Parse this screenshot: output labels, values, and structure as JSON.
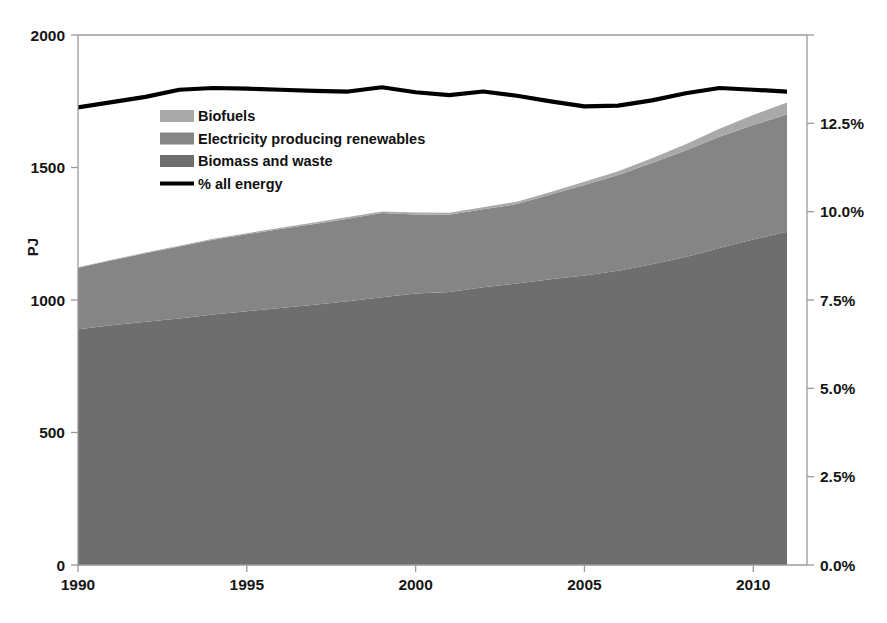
{
  "chart_data": {
    "type": "area",
    "title": "",
    "subtitle": "",
    "xlabel": "",
    "ylabel": "PJ",
    "y2label": "",
    "grid": false,
    "legend_position": "inside-upper-left",
    "xlim": [
      1990,
      2011
    ],
    "ylim": [
      0,
      2000
    ],
    "y2lim": [
      0.0,
      15.0
    ],
    "x_ticks": [
      1990,
      1995,
      2000,
      2005,
      2010
    ],
    "x_tick_labels": [
      "1990",
      "1995",
      "2000",
      "2005",
      "2010"
    ],
    "y_ticks": [
      0,
      500,
      1000,
      1500,
      2000
    ],
    "y_tick_labels": [
      "0",
      "500",
      "1000",
      "1500",
      "2000"
    ],
    "y2_ticks": [
      0.0,
      2.5,
      5.0,
      7.5,
      10.0,
      12.5
    ],
    "y2_tick_labels": [
      "0.0%",
      "2.5%",
      "5.0%",
      "7.5%",
      "10.0%",
      "12.5%"
    ],
    "x": [
      1990,
      1991,
      1992,
      1993,
      1994,
      1995,
      1996,
      1997,
      1998,
      1999,
      2000,
      2001,
      2002,
      2003,
      2004,
      2005,
      2006,
      2007,
      2008,
      2009,
      2010,
      2011
    ],
    "stack_order": [
      "Biomass and waste",
      "Electricity producing renewables",
      "Biofuels"
    ],
    "series": [
      {
        "name": "Biomass and waste",
        "axis": "left",
        "units": "PJ",
        "color": "#6e6e6e",
        "values": [
          890,
          905,
          918,
          930,
          945,
          958,
          970,
          982,
          995,
          1010,
          1025,
          1030,
          1048,
          1062,
          1078,
          1092,
          1110,
          1135,
          1162,
          1196,
          1228,
          1258
        ]
      },
      {
        "name": "Electricity producing renewables",
        "axis": "left",
        "units": "PJ",
        "color": "#858585",
        "values": [
          232,
          245,
          258,
          272,
          282,
          290,
          298,
          305,
          312,
          318,
          298,
          292,
          294,
          300,
          320,
          342,
          362,
          382,
          402,
          420,
          432,
          442
        ]
      },
      {
        "name": "Biofuels",
        "axis": "left",
        "units": "PJ",
        "color": "#a9a9a9",
        "values": [
          2,
          2,
          3,
          3,
          4,
          4,
          5,
          5,
          6,
          6,
          7,
          7,
          8,
          9,
          10,
          12,
          14,
          18,
          24,
          30,
          38,
          45
        ]
      },
      {
        "name": "% all energy",
        "axis": "right",
        "units": "%",
        "color": "#000000",
        "style": "line",
        "values": [
          12.95,
          13.1,
          13.25,
          13.45,
          13.5,
          13.48,
          13.45,
          13.42,
          13.4,
          13.52,
          13.38,
          13.3,
          13.4,
          13.28,
          13.12,
          12.98,
          13.0,
          13.15,
          13.35,
          13.5,
          13.45,
          13.4
        ]
      }
    ],
    "legend_entries": [
      {
        "label": "Biofuels",
        "swatch": "#a9a9a9",
        "type": "area"
      },
      {
        "label": "Electricity producing renewables",
        "swatch": "#858585",
        "type": "area"
      },
      {
        "label": "Biomass and waste",
        "swatch": "#6e6e6e",
        "type": "area"
      },
      {
        "label": "% all energy",
        "swatch": "#000000",
        "type": "line"
      }
    ]
  },
  "colors": {
    "biofuels": "#a9a9a9",
    "electricity_renewables": "#858585",
    "biomass_waste": "#6e6e6e",
    "percent_line": "#000000",
    "axis": "#9a9a9a",
    "text": "#151515",
    "background": "#ffffff"
  }
}
